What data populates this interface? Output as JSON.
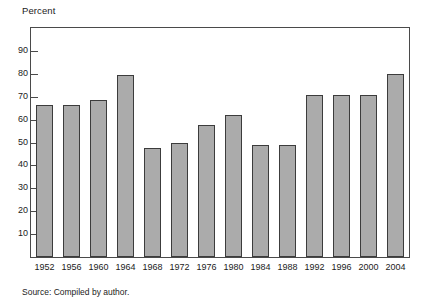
{
  "figure": {
    "unit_label": "Percent",
    "source_note": "Source: Compiled by author."
  },
  "colors": {
    "bar_fill": "#ababab",
    "bar_border": "#3c3c3c",
    "frame": "#4a4a4a",
    "text": "#1b1b1b",
    "background": "#ffffff"
  },
  "chart_data": {
    "type": "bar",
    "title": "",
    "subtitle": "",
    "xlabel": "",
    "ylabel": "Percent",
    "ylim": [
      0,
      100
    ],
    "xlim_note": "14 categories, evenly spaced",
    "ytick_values": [
      10,
      20,
      30,
      40,
      50,
      60,
      70,
      80,
      90
    ],
    "ytick_labels": [
      "10",
      "20",
      "30",
      "40",
      "50",
      "60",
      "70",
      "80",
      "90"
    ],
    "grid": false,
    "legend": null,
    "annotations": [
      "Source: Compiled by author."
    ],
    "categories": [
      "1952",
      "1956",
      "1960",
      "1964",
      "1968",
      "1972",
      "1976",
      "1980",
      "1984",
      "1988",
      "1992",
      "1996",
      "2000",
      "2004"
    ],
    "values": [
      66.5,
      66.5,
      68.5,
      79.5,
      47.5,
      50.0,
      57.8,
      62.0,
      49.0,
      49.0,
      70.8,
      70.8,
      70.8,
      79.8
    ]
  }
}
